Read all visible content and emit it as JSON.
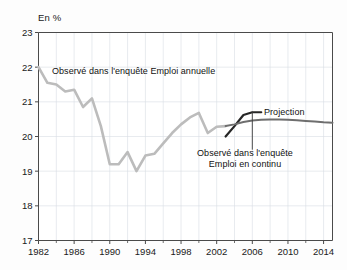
{
  "chart_data": {
    "type": "line",
    "title": "",
    "subtitle": "",
    "unit_label": "En %",
    "xlabel": "",
    "ylabel": "",
    "xlim": [
      1982,
      2015
    ],
    "ylim": [
      17,
      23
    ],
    "ytick_values": [
      17,
      18,
      19,
      20,
      21,
      22,
      23
    ],
    "ytick_labels": [
      "17",
      "18",
      "19",
      "20",
      "21",
      "22",
      "23"
    ],
    "xtick_values": [
      1982,
      1986,
      1990,
      1994,
      1998,
      2002,
      2006,
      2010,
      2014
    ],
    "xtick_labels": [
      "1982",
      "1986",
      "1990",
      "1994",
      "1998",
      "2002",
      "2006",
      "2010",
      "2014"
    ],
    "xminor_values": [
      1984,
      1988,
      1992,
      1996,
      2000,
      2004,
      2008,
      2012
    ],
    "grid": true,
    "grid_color": "#d9dde4",
    "legend_position": "inline-annotations",
    "series": [
      {
        "name": "Observé dans l'enquête Emploi annuelle",
        "color": "#bcbcbc",
        "width": 2.6,
        "x": [
          1982,
          1983,
          1984,
          1985,
          1986,
          1987,
          1988,
          1989,
          1990,
          1991,
          1992,
          1993,
          1994,
          1995,
          1996,
          1997,
          1998,
          1999,
          2000,
          2001,
          2002,
          2003
        ],
        "values": [
          22.0,
          21.55,
          21.5,
          21.3,
          21.35,
          20.85,
          21.1,
          20.3,
          19.2,
          19.2,
          19.55,
          19.0,
          19.45,
          19.5,
          19.8,
          20.1,
          20.35,
          20.55,
          20.68,
          20.1,
          20.28,
          20.3
        ]
      },
      {
        "name": "Observé dans l'enquête Emploi en continu",
        "color": "#262626",
        "width": 2.2,
        "x": [
          2003,
          2004,
          2005,
          2006,
          2007
        ],
        "values": [
          20.0,
          20.3,
          20.62,
          20.7,
          20.7
        ]
      },
      {
        "name": "Projection",
        "color": "#6e6e6e",
        "width": 2.0,
        "x": [
          2003,
          2004,
          2005,
          2006,
          2007,
          2008,
          2009,
          2010,
          2011,
          2012,
          2013,
          2014,
          2015
        ],
        "values": [
          20.3,
          20.35,
          20.42,
          20.46,
          20.48,
          20.49,
          20.49,
          20.48,
          20.47,
          20.45,
          20.43,
          20.41,
          20.4
        ]
      }
    ],
    "annotations": [
      {
        "name": "annot-annuelle",
        "text": "Observé dans l'enquête Emploi annuelle",
        "leader": false
      },
      {
        "name": "annot-continu",
        "line1": "Observé dans l'enquête",
        "line2": "Emploi en continu",
        "leader": true,
        "leader_from": [
          2006.0,
          20.72
        ],
        "leader_to": [
          2006.0,
          19.62
        ]
      },
      {
        "name": "annot-projection",
        "text": "Projection",
        "leader": false
      }
    ]
  },
  "axis": {
    "frame_color": "#4a4a4a",
    "tick_color": "#4a4a4a"
  }
}
